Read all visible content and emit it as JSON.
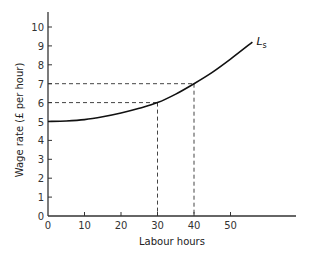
{
  "chart_data": {
    "type": "line",
    "title": "",
    "xlabel": "Labour hours",
    "ylabel": "Wage rate (£ per hour)",
    "xlim": [
      0,
      68
    ],
    "ylim": [
      0,
      10.5
    ],
    "x_ticks": [
      0,
      10,
      20,
      30,
      40,
      50
    ],
    "y_ticks": [
      0,
      1,
      2,
      3,
      4,
      5,
      6,
      7,
      8,
      9,
      10
    ],
    "grid": false,
    "legend": null,
    "series": [
      {
        "name": "Ls",
        "label_main": "L",
        "label_sub": "s",
        "x": [
          0,
          5,
          10,
          15,
          20,
          25,
          30,
          35,
          40,
          45,
          50,
          56
        ],
        "values": [
          5.0,
          5.03,
          5.1,
          5.25,
          5.45,
          5.7,
          6.0,
          6.45,
          7.0,
          7.6,
          8.3,
          9.2
        ]
      }
    ],
    "annotations": [
      {
        "type": "dashed-guide",
        "x": 30,
        "y": 6
      },
      {
        "type": "dashed-guide",
        "x": 40,
        "y": 7
      }
    ],
    "colors": {
      "axis": "#333333",
      "curve": "#111111",
      "guide": "#444444"
    }
  }
}
